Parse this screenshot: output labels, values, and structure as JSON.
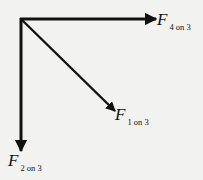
{
  "diagram": {
    "type": "free-body force diagram",
    "origin": {
      "x": 21,
      "y": 19
    },
    "stroke_color": "#111111",
    "background": "#f2f2f0",
    "vectors": [
      {
        "id": "f4on3",
        "symbol": "F",
        "subscript": "4 on 3",
        "direction": "right",
        "tip": {
          "x": 157,
          "y": 19
        },
        "label_pos": {
          "x": 158,
          "y": 12
        }
      },
      {
        "id": "f1on3",
        "symbol": "F",
        "subscript": "1 on 3",
        "direction": "down-right",
        "tip": {
          "x": 116,
          "y": 112
        },
        "label_pos": {
          "x": 116,
          "y": 106
        }
      },
      {
        "id": "f2on3",
        "symbol": "F",
        "subscript": "2 on 3",
        "direction": "down",
        "tip": {
          "x": 21,
          "y": 152
        },
        "label_pos": {
          "x": 8,
          "y": 151
        }
      }
    ]
  }
}
